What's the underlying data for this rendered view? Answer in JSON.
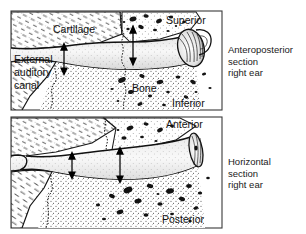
{
  "figure": {
    "background_color": "#ffffff",
    "ink_color": "#111111",
    "panel_border_color": "#3a3a3a",
    "stipple_color": "#2b2b2b",
    "panels": [
      {
        "id": "anteroposterior",
        "caption_lines": [
          "Anteroposterior",
          "section",
          "right ear"
        ],
        "labels": [
          {
            "name": "cartilage",
            "text": "Cartilage"
          },
          {
            "name": "external-auditory-canal",
            "text_lines": [
              "External",
              "auditory",
              "canal"
            ]
          },
          {
            "name": "bone",
            "text": "Bone"
          },
          {
            "name": "superior",
            "text": "Superior"
          },
          {
            "name": "inferior",
            "text": "Inferior"
          }
        ],
        "arrows": [
          {
            "name": "canal-diameter-arrow-lateral",
            "style": "double-headed-vertical"
          },
          {
            "name": "canal-diameter-arrow-medial",
            "style": "double-headed-vertical"
          }
        ],
        "structures": [
          "pinna",
          "cartilaginous-canal",
          "bony-canal",
          "tympanic-membrane",
          "marrow-spaces"
        ]
      },
      {
        "id": "horizontal",
        "caption_lines": [
          "Horizontal",
          "section",
          "right ear"
        ],
        "labels": [
          {
            "name": "anterior",
            "text": "Anterior"
          },
          {
            "name": "posterior",
            "text": "Posterior"
          }
        ],
        "arrows": [
          {
            "name": "canal-diameter-arrow-lateral",
            "style": "double-headed-vertical"
          },
          {
            "name": "canal-diameter-arrow-medial",
            "style": "double-headed-vertical"
          }
        ],
        "structures": [
          "cartilaginous-canal",
          "bony-canal",
          "tympanic-membrane",
          "marrow-spaces"
        ]
      }
    ]
  },
  "labels": {
    "cartilage": "Cartilage",
    "bone": "Bone",
    "canal_line1": "External",
    "canal_line2": "auditory",
    "canal_line3": "canal",
    "superior": "Superior",
    "inferior": "Inferior",
    "anterior": "Anterior",
    "posterior": "Posterior"
  },
  "captions": {
    "ap_line1": "Anteroposterior",
    "ap_line2": "section",
    "ap_line3": "right ear",
    "hz_line1": "Horizontal",
    "hz_line2": "section",
    "hz_line3": "right ear"
  }
}
